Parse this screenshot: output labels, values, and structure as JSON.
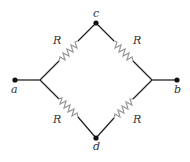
{
  "diagram": {
    "type": "resistor bridge circuit",
    "nodes": {
      "a": {
        "label": "a"
      },
      "b": {
        "label": "b"
      },
      "c": {
        "label": "c"
      },
      "d": {
        "label": "d"
      }
    },
    "resistors": [
      {
        "id": "ac",
        "label": "R",
        "between": [
          "a",
          "c"
        ]
      },
      {
        "id": "cb",
        "label": "R",
        "between": [
          "c",
          "b"
        ]
      },
      {
        "id": "ad",
        "label": "R",
        "between": [
          "a",
          "d"
        ]
      },
      {
        "id": "db",
        "label": "R",
        "between": [
          "d",
          "b"
        ]
      }
    ],
    "colors": {
      "wire": "#222222",
      "resistor": "#999999",
      "node": "#111111"
    }
  }
}
